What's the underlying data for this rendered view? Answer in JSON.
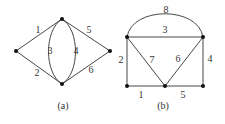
{
  "graph_a": {
    "caption": "(a)",
    "nodes": [
      {
        "id": "L",
        "x": 16,
        "y": 51
      },
      {
        "id": "T",
        "x": 62,
        "y": 19
      },
      {
        "id": "B",
        "x": 62,
        "y": 84
      },
      {
        "id": "R",
        "x": 110,
        "y": 51
      }
    ],
    "edges": [
      {
        "label": "1",
        "from": "L",
        "to": "T"
      },
      {
        "label": "2",
        "from": "L",
        "to": "B"
      },
      {
        "label": "3",
        "from": "T",
        "to": "B",
        "shape": "left-arc"
      },
      {
        "label": "4",
        "from": "T",
        "to": "B",
        "shape": "right-arc"
      },
      {
        "label": "5",
        "from": "T",
        "to": "R"
      },
      {
        "label": "6",
        "from": "B",
        "to": "R"
      }
    ]
  },
  "graph_b": {
    "caption": "(b)",
    "nodes": [
      {
        "id": "TL",
        "x": 127,
        "y": 37
      },
      {
        "id": "TR",
        "x": 203,
        "y": 37
      },
      {
        "id": "BL",
        "x": 127,
        "y": 86
      },
      {
        "id": "BM",
        "x": 165,
        "y": 86
      },
      {
        "id": "BR",
        "x": 203,
        "y": 86
      }
    ],
    "edges": [
      {
        "label": "8",
        "from": "TL",
        "to": "TR",
        "shape": "top-arc"
      },
      {
        "label": "3",
        "from": "TL",
        "to": "TR"
      },
      {
        "label": "2",
        "from": "TL",
        "to": "BL"
      },
      {
        "label": "7",
        "from": "TL",
        "to": "BM"
      },
      {
        "label": "6",
        "from": "TR",
        "to": "BM"
      },
      {
        "label": "4",
        "from": "TR",
        "to": "BR"
      },
      {
        "label": "1",
        "from": "BL",
        "to": "BM"
      },
      {
        "label": "5",
        "from": "BM",
        "to": "BR"
      }
    ]
  }
}
